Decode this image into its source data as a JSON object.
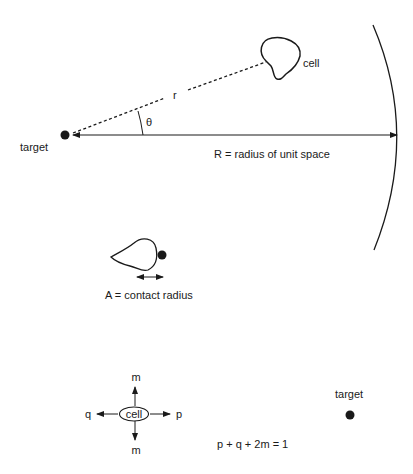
{
  "diagram": {
    "top": {
      "target_label": "target",
      "cell_label": "cell",
      "distance_label": "r",
      "angle_label": "θ",
      "radius_label": "R = radius of unit space"
    },
    "contact": {
      "label": "A = contact radius"
    },
    "movement": {
      "cell_label": "cell",
      "up_label": "m",
      "down_label": "m",
      "left_label": "q",
      "right_label": "p",
      "equation": "p + q + 2m = 1",
      "target_label": "target"
    },
    "colors": {
      "ink": "#1a1a1a",
      "background": "#ffffff"
    }
  }
}
